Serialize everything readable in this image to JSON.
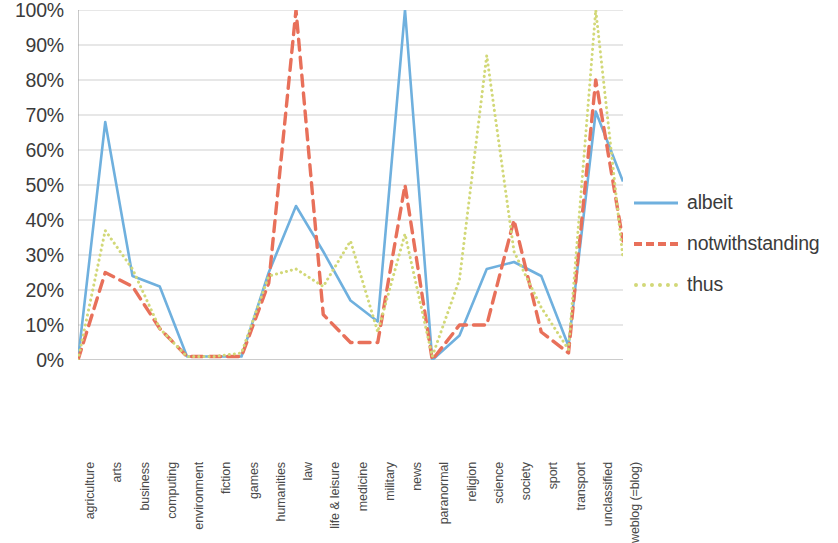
{
  "chart_data": {
    "type": "line",
    "title": "",
    "xlabel": "",
    "ylabel": "",
    "ylim": [
      0,
      100
    ],
    "ytick_labels": [
      "100%",
      "90%",
      "80%",
      "70%",
      "60%",
      "50%",
      "40%",
      "30%",
      "20%",
      "10%",
      "0%"
    ],
    "ytick_values": [
      100,
      90,
      80,
      70,
      60,
      50,
      40,
      30,
      20,
      10,
      0
    ],
    "grid": true,
    "legend_position": "right",
    "categories": [
      "agriculture",
      "arts",
      "business",
      "computing",
      "environment",
      "fiction",
      "games",
      "humanities",
      "law",
      "life & leisure",
      "medicine",
      "military",
      "news",
      "paranormal",
      "religion",
      "science",
      "society",
      "sport",
      "transport",
      "unclassified",
      "weblog (=blog)"
    ],
    "series": [
      {
        "name": "albeit",
        "color": "#6FB0DE",
        "style": "solid",
        "values": [
          0,
          68,
          24,
          21,
          1,
          1,
          1,
          25,
          44,
          31,
          17,
          11,
          100,
          0,
          7,
          26,
          28,
          24,
          4,
          71,
          51
        ]
      },
      {
        "name": "notwithstanding",
        "color": "#E8705A",
        "style": "dashed",
        "values": [
          0,
          25,
          21,
          9,
          1,
          1,
          1,
          22,
          100,
          13,
          5,
          5,
          50,
          0,
          10,
          10,
          40,
          8,
          2,
          80,
          34
        ]
      },
      {
        "name": "thus",
        "color": "#D2D878",
        "style": "dotted",
        "values": [
          0,
          37,
          26,
          9,
          1,
          1,
          2,
          24,
          26,
          21,
          34,
          8,
          36,
          1,
          23,
          87,
          31,
          15,
          3,
          100,
          29
        ]
      }
    ]
  },
  "legend": {
    "items": [
      {
        "label": "albeit"
      },
      {
        "label": "notwithstanding"
      },
      {
        "label": "thus"
      }
    ]
  }
}
